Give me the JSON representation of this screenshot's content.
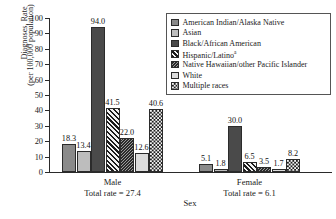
{
  "chart_data": {
    "type": "bar",
    "title": "",
    "xlabel": "Sex",
    "ylabel": "Diagnoses, Rate (per 100,000 population)",
    "ylim": [
      0,
      100
    ],
    "yticks": [
      0,
      10,
      20,
      30,
      40,
      50,
      60,
      70,
      80,
      90,
      100
    ],
    "grid": false,
    "legend_position": "top-right",
    "categories": [
      "Male",
      "Female"
    ],
    "series": [
      {
        "name": "American Indian/Alaska Native",
        "values": [
          18.3,
          5.1
        ]
      },
      {
        "name": "Asian",
        "values": [
          13.4,
          1.8
        ]
      },
      {
        "name": "Black/African American",
        "values": [
          94.0,
          30.0
        ]
      },
      {
        "name": "Hispanic/Latino",
        "values": [
          41.5,
          6.5
        ]
      },
      {
        "name": "Native Hawaiian/other Pacific Islander",
        "values": [
          22.0,
          3.5
        ]
      },
      {
        "name": "White",
        "values": [
          12.6,
          1.7
        ]
      },
      {
        "name": "Multiple races",
        "values": [
          40.6,
          8.2
        ]
      }
    ],
    "annotations": [
      {
        "text": "Total rate = 27.4",
        "group": "Male"
      },
      {
        "text": "Total rate = 6.1",
        "group": "Female"
      }
    ]
  },
  "axes": {
    "ylabel_line1": "Diagnoses, Rate",
    "ylabel_line2": "(per 100,000 population)",
    "xlabel": "Sex",
    "ticklabels": [
      "100",
      "90",
      "80",
      "70",
      "60",
      "50",
      "40",
      "30",
      "20",
      "10",
      "0"
    ]
  },
  "groups": [
    {
      "name": "Male",
      "label": "Male",
      "total_label": "Total rate = 27.4"
    },
    {
      "name": "Female",
      "label": "Female",
      "total_label": "Total rate = 6.1"
    }
  ],
  "legend": {
    "items": [
      {
        "label": "American Indian/Alaska Native",
        "swatch": "solid-medium-gray-swatch",
        "pattern": "p-aian",
        "footnote": ""
      },
      {
        "label": "Asian",
        "swatch": "solid-light-gray-swatch",
        "pattern": "p-asian",
        "footnote": ""
      },
      {
        "label": "Black/African American",
        "swatch": "solid-dark-gray-swatch",
        "pattern": "p-black",
        "footnote": ""
      },
      {
        "label": "Hispanic/Latino",
        "swatch": "diagonal-hatch-swatch",
        "pattern": "p-hisp",
        "footnote": "a"
      },
      {
        "label": "Native Hawaiian/other Pacific Islander",
        "swatch": "fine-diagonal-swatch",
        "pattern": "p-nhopi",
        "footnote": ""
      },
      {
        "label": "White",
        "swatch": "solid-pale-gray-swatch",
        "pattern": "p-white",
        "footnote": ""
      },
      {
        "label": "Multiple races",
        "swatch": "checkerboard-swatch",
        "pattern": "p-multi",
        "footnote": ""
      }
    ]
  },
  "bar_labels": {
    "male": [
      "18.3",
      "13.4",
      "94.0",
      "41.5",
      "22.0",
      "12.6",
      "40.6"
    ],
    "female": [
      "5.1",
      "1.8",
      "30.0",
      "6.5",
      "3.5",
      "1.7",
      "8.2"
    ]
  }
}
